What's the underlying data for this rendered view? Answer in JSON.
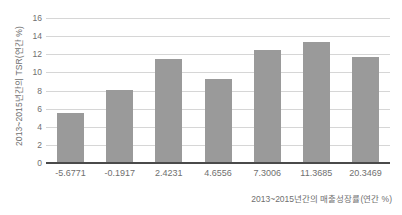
{
  "chart_data": {
    "type": "bar",
    "title": "",
    "subtitle": "",
    "categories": [
      "-5.6771",
      "-0.1917",
      "2.4231",
      "4.6556",
      "7.3006",
      "11.3685",
      "20.3469"
    ],
    "values": [
      5.5,
      8.1,
      11.5,
      9.3,
      12.5,
      13.3,
      11.75
    ],
    "series": [
      {
        "name": "TSR",
        "values": [
          5.5,
          8.1,
          11.5,
          9.3,
          12.5,
          13.3,
          11.75
        ]
      }
    ],
    "xlabel": "2013~2015년간의 매출성장률(연간 %)",
    "ylabel": "2013~2015년간의 TSR(연간 %)",
    "ylim": [
      0,
      16
    ],
    "yticks": [
      "16",
      "14",
      "12",
      "10",
      "8",
      "6",
      "4",
      "2",
      "0"
    ],
    "ytick_values": [
      16,
      14,
      12,
      10,
      8,
      6,
      4,
      2,
      0
    ],
    "grid": true,
    "legend": false,
    "legend_position": "none",
    "colors": {
      "bar": "#9a9a9a",
      "gridline": "#d6d6d6",
      "axis": "#4a4a4a",
      "text": "#6f6f6f",
      "background": "#ffffff"
    }
  }
}
